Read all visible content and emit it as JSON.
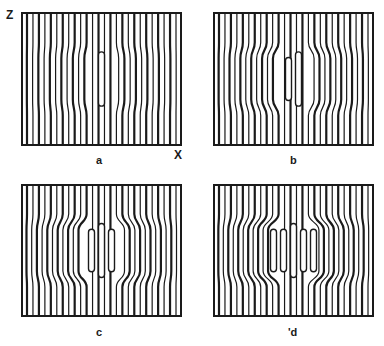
{
  "figure": {
    "axis_labels": {
      "vertical": "Z",
      "horizontal": "X"
    },
    "panels": [
      {
        "id": "a",
        "label": "a",
        "stage": 0,
        "x": 21,
        "y": 12,
        "w": 161,
        "h": 134,
        "label_x": 96,
        "label_y": 155
      },
      {
        "id": "b",
        "label": "b",
        "stage": 1,
        "x": 213,
        "y": 12,
        "w": 161,
        "h": 134,
        "label_x": 290,
        "label_y": 155
      },
      {
        "id": "c",
        "label": "c",
        "stage": 2,
        "x": 21,
        "y": 184,
        "w": 161,
        "h": 133,
        "label_x": 96,
        "label_y": 327
      },
      {
        "id": "d",
        "label": "'d",
        "stage": 3,
        "x": 213,
        "y": 184,
        "w": 161,
        "h": 133,
        "label_x": 288,
        "label_y": 327
      }
    ],
    "stripe_count": 26,
    "stroke_color": "#1a1a1a"
  }
}
